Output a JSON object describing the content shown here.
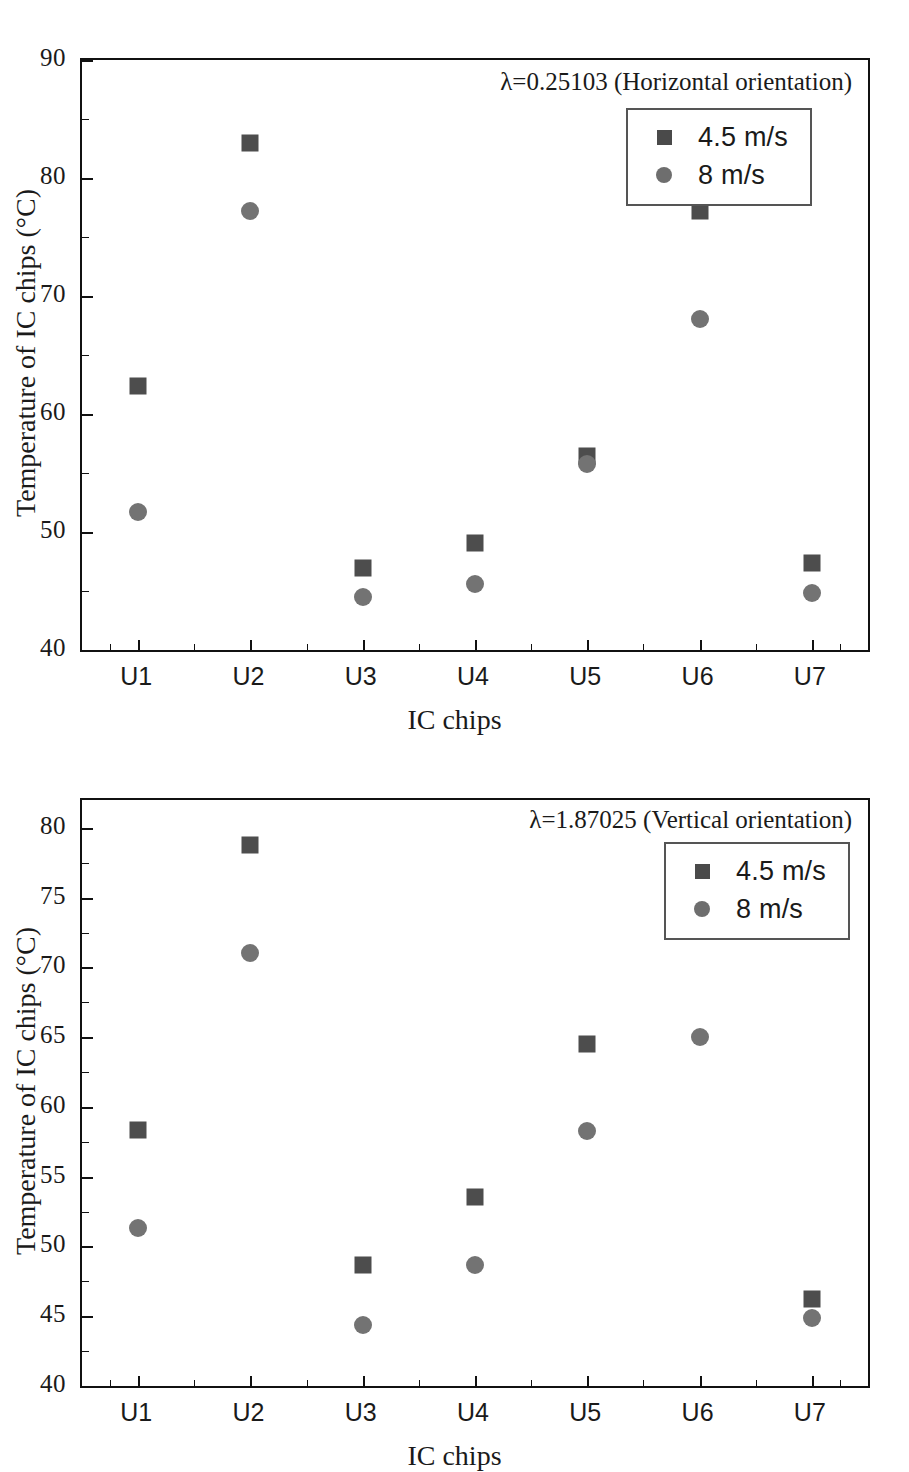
{
  "figure": {
    "background": "#ffffff",
    "marker_square_color": "#4d4d4d",
    "marker_circle_color": "#737373"
  },
  "chart_data": [
    {
      "type": "scatter",
      "panel": "top",
      "title": "",
      "annotation": "λ=0.25103 (Horizontal orientation)",
      "xlabel": "IC chips",
      "ylabel": "Temperature of IC chips (°C)",
      "categories": [
        "U1",
        "U2",
        "U3",
        "U4",
        "U5",
        "U6",
        "U7"
      ],
      "ylim": [
        40,
        90
      ],
      "yticks": [
        40,
        50,
        60,
        70,
        80,
        90
      ],
      "yticks_minor": [
        45,
        55,
        65,
        75,
        85
      ],
      "grid": false,
      "legend_position": "top-right",
      "series": [
        {
          "name": "4.5 m/s",
          "marker": "square",
          "values": [
            62.2,
            82.8,
            46.8,
            48.9,
            56.3,
            77.0,
            47.2
          ]
        },
        {
          "name": "8 m/s",
          "marker": "circle",
          "values": [
            51.5,
            77.0,
            44.3,
            45.4,
            55.6,
            67.9,
            44.7
          ]
        }
      ]
    },
    {
      "type": "scatter",
      "panel": "bottom",
      "title": "",
      "annotation": "λ=1.87025 (Vertical orientation)",
      "xlabel": "IC chips",
      "ylabel": "Temperature of IC chips (°C)",
      "categories": [
        "U1",
        "U2",
        "U3",
        "U4",
        "U5",
        "U6",
        "U7"
      ],
      "ylim": [
        40,
        82
      ],
      "yticks": [
        40,
        45,
        50,
        55,
        60,
        65,
        70,
        75,
        80
      ],
      "yticks_minor": [
        42.5,
        47.5,
        52.5,
        57.5,
        62.5,
        67.5,
        72.5,
        77.5
      ],
      "grid": false,
      "legend_position": "top-right",
      "series": [
        {
          "name": "4.5 m/s",
          "marker": "square",
          "values": [
            58.2,
            78.6,
            48.5,
            53.4,
            64.4,
            74.8,
            46.1
          ]
        },
        {
          "name": "8 m/s",
          "marker": "circle",
          "values": [
            51.2,
            70.9,
            44.2,
            48.5,
            58.1,
            64.9,
            44.7
          ]
        }
      ]
    }
  ]
}
